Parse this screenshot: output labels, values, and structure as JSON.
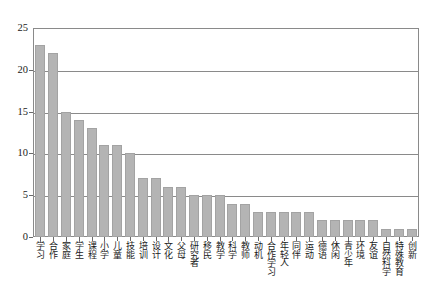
{
  "chart_data": {
    "type": "bar",
    "title": "",
    "subtitle": "",
    "xlabel": "",
    "ylabel": "",
    "ylim": [
      0,
      25
    ],
    "yticks": [
      0,
      5,
      10,
      15,
      20,
      25
    ],
    "grid": true,
    "legend": false,
    "legend_position": "none",
    "bar_color": "#b4b4b4",
    "bar_edge_color": "#a3a3a3",
    "axis_color": "#8a8a8a",
    "background_color": "#ffffff",
    "categories": [
      "学习",
      "合作",
      "家庭",
      "学生",
      "课程",
      "小学",
      "儿童",
      "技能",
      "培训",
      "设计",
      "文化",
      "父母",
      "研究者",
      "移民",
      "教学",
      "科学",
      "教师",
      "动机",
      "合作学习",
      "年轻人",
      "同伴",
      "运动",
      "德语",
      "休闲",
      "青少年",
      "环境",
      "友谊",
      "自然科学",
      "特殊教育",
      "创新"
    ],
    "values": [
      23,
      22,
      15,
      14,
      13,
      11,
      11,
      10,
      7,
      7,
      6,
      6,
      5,
      5,
      5,
      4,
      4,
      3,
      3,
      3,
      3,
      3,
      2,
      2,
      2,
      2,
      2,
      1,
      1,
      1
    ]
  }
}
